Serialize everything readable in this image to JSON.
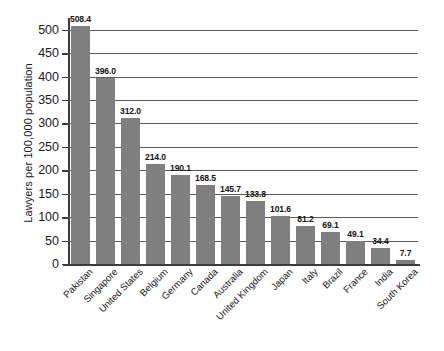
{
  "chart_data": {
    "type": "bar",
    "title": "",
    "subtitle": "",
    "xlabel": "",
    "ylabel": "Lawyers per 100,000 population",
    "ylim": [
      0,
      525
    ],
    "yticks": [
      0,
      50,
      100,
      150,
      200,
      250,
      300,
      350,
      400,
      450,
      500
    ],
    "ytick_labels": [
      "0",
      "50",
      "100",
      "150",
      "200",
      "250",
      "300",
      "350",
      "400",
      "450",
      "500"
    ],
    "grid": "horizontal",
    "legend": "none",
    "bar_color": "#7f7f7f",
    "categories": [
      "Pakistan",
      "Singapore",
      "United States",
      "Belgium",
      "Germany",
      "Canada",
      "Australia",
      "United Kingdom",
      "Japan",
      "Italy",
      "Brazil",
      "France",
      "India",
      "South Korea"
    ],
    "values": [
      508.4,
      396.0,
      312.0,
      214.0,
      190.1,
      168.5,
      145.7,
      133.8,
      101.6,
      81.2,
      69.1,
      49.1,
      34.4,
      7.7
    ],
    "value_labels": [
      "508.4",
      "396.0",
      "312.0",
      "214.0",
      "190.1",
      "168.5",
      "145.7",
      "133.8",
      "101.6",
      "81.2",
      "69.1",
      "49.1",
      "34.4",
      "7.7"
    ]
  }
}
